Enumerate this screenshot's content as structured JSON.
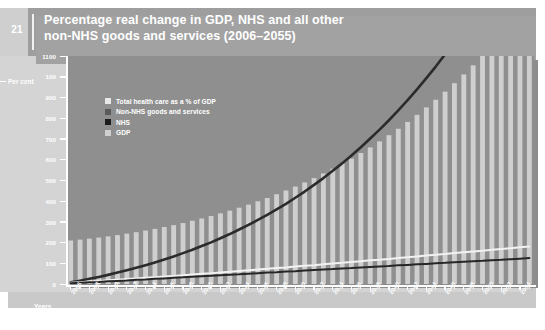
{
  "page": {
    "number": "21",
    "title_line1": "Percentage real change in GDP, NHS and all other",
    "title_line2": "non-NHS goods and services (2006–2055)",
    "header_bg": "#9e9e9e",
    "panel_bg": "#d4d4d4"
  },
  "axis_captions": {
    "y_caption": "Per cent",
    "x_caption": "Years"
  },
  "legend": {
    "position": "inside-top-left",
    "items": [
      {
        "label": "Total health care as a % of GDP",
        "color": "#e8e8e8"
      },
      {
        "label": "Non-NHS goods and services",
        "color": "#5a5a5a"
      },
      {
        "label": "NHS",
        "color": "#1c1c1c"
      },
      {
        "label": "GDP",
        "color": "#cfcfcf"
      }
    ]
  },
  "chart_data": {
    "type": "bar",
    "title": "Percentage real change in GDP, NHS and all other non-NHS goods and services (2006–2055)",
    "xlabel": "Years",
    "ylabel": "Per cent",
    "ylim": [
      0,
      1100
    ],
    "ytick_step": 100,
    "grid": false,
    "plot_bg": "#8f8f8f",
    "yticks": [
      0,
      100,
      200,
      300,
      400,
      500,
      600,
      700,
      800,
      900,
      1000,
      1100
    ],
    "ytick_labels": [
      "0",
      "100",
      "200",
      "300",
      "400",
      "500",
      "600",
      "700",
      "800",
      "900",
      "100",
      "1100"
    ],
    "categories": [
      "2006",
      "2007",
      "2008",
      "2009",
      "2010",
      "2011",
      "2012",
      "2013",
      "2014",
      "2015",
      "2016",
      "2017",
      "2018",
      "2019",
      "2020",
      "2021",
      "2022",
      "2023",
      "2024",
      "2025",
      "2026",
      "2027",
      "2028",
      "2029",
      "2030",
      "2031",
      "2032",
      "2033",
      "2034",
      "2035",
      "2036",
      "2037",
      "2038",
      "2039",
      "2040",
      "2041",
      "2042",
      "2043",
      "2044",
      "2045",
      "2046",
      "2047",
      "2048",
      "2049",
      "2050",
      "2051",
      "2052",
      "2053",
      "2054",
      "2055"
    ],
    "xtick_labels_shown": [
      "2006",
      "2008",
      "2010",
      "2012",
      "2014",
      "2016",
      "2018",
      "2020",
      "2022",
      "2024",
      "2026",
      "2028",
      "2030",
      "2032",
      "2034",
      "2036",
      "2038",
      "2040",
      "2042",
      "2044",
      "2046",
      "2048",
      "2050",
      "2052",
      "2054"
    ],
    "series": [
      {
        "name": "GDP",
        "type": "bar",
        "color": "#cfcfcf",
        "values": [
          210,
          214,
          219,
          224,
          230,
          236,
          243,
          250,
          258,
          266,
          275,
          284,
          294,
          305,
          316,
          328,
          341,
          354,
          368,
          383,
          399,
          415,
          433,
          451,
          470,
          490,
          511,
          533,
          556,
          580,
          605,
          632,
          659,
          688,
          718,
          749,
          782,
          816,
          852,
          889,
          928,
          969,
          1011,
          1055,
          1102,
          1150,
          1201,
          1254,
          1309,
          1367
        ]
      },
      {
        "name": "Non-NHS goods and services",
        "type": "line",
        "color": "#2b2b2b",
        "values": [
          8,
          16,
          25,
          34,
          44,
          55,
          66,
          78,
          91,
          104,
          118,
          133,
          149,
          165,
          183,
          201,
          221,
          241,
          263,
          285,
          309,
          334,
          360,
          387,
          416,
          446,
          478,
          511,
          546,
          582,
          620,
          660,
          702,
          745,
          790,
          838,
          887,
          939,
          993,
          1049,
          1108,
          1169,
          1233,
          1300,
          1369,
          1442,
          1517,
          1596,
          1678,
          1763
        ],
        "note": "Steep rising curve; clipped at top of plot near 2055"
      },
      {
        "name": "Total health care as a % of GDP",
        "type": "line",
        "color": "#f2f2f2",
        "values": [
          6,
          9,
          12,
          15,
          18,
          21,
          24,
          27,
          30,
          33,
          36,
          39,
          42,
          46,
          49,
          52,
          56,
          59,
          63,
          66,
          70,
          73,
          77,
          80,
          84,
          88,
          91,
          95,
          99,
          102,
          106,
          110,
          114,
          117,
          121,
          125,
          129,
          133,
          137,
          141,
          145,
          149,
          153,
          157,
          161,
          165,
          169,
          173,
          177,
          181
        ]
      },
      {
        "name": "NHS",
        "type": "line",
        "color": "#262626",
        "values": [
          4,
          6,
          8,
          10,
          13,
          15,
          17,
          20,
          22,
          25,
          27,
          30,
          32,
          35,
          37,
          40,
          42,
          45,
          47,
          50,
          52,
          55,
          57,
          60,
          62,
          65,
          67,
          70,
          72,
          75,
          77,
          80,
          82,
          85,
          87,
          90,
          92,
          95,
          97,
          100,
          102,
          105,
          107,
          110,
          112,
          115,
          117,
          120,
          122,
          125
        ]
      }
    ]
  }
}
